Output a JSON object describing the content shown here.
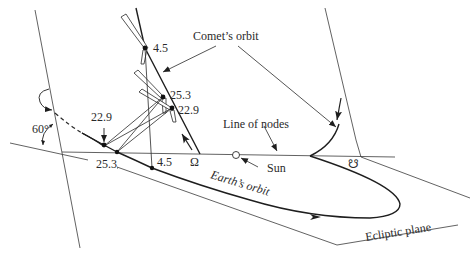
{
  "figure": {
    "labels": {
      "comets_orbit": "Comet’s orbit",
      "line_of_nodes": "Line of nodes",
      "sun": "Sun",
      "earths_orbit": "Earth’s orbit",
      "ecliptic_plane": "Ecliptic plane",
      "ascending_node": "Ω",
      "descending_node": "☋",
      "inclination": "60°"
    },
    "comet_positions": [
      {
        "date_label": "4.5"
      },
      {
        "date_label": "25.3"
      },
      {
        "date_label": "22.9"
      }
    ],
    "earth_positions": [
      {
        "date_label": "22.9"
      },
      {
        "date_label": "25.3"
      },
      {
        "date_label": "4.5"
      }
    ],
    "colors": {
      "line": "#2a2a2a",
      "background": "#ffffff"
    }
  }
}
